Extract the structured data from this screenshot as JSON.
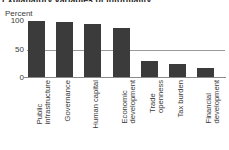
{
  "chart_data": {
    "type": "bar",
    "title": "Explanatory variables of informality",
    "subtitle": "",
    "ylabel": "Percent",
    "xlabel": "",
    "ylim": [
      0,
      100
    ],
    "yticks": [
      0,
      50,
      100
    ],
    "ytick_labels": [
      "0",
      "50",
      "100"
    ],
    "grid": false,
    "legend": "none",
    "bar_color": "#3b3b3b",
    "reference_line": {
      "value": 50,
      "color": "#9a9a9a",
      "label": ""
    },
    "categories": [
      "Public infrastructure",
      "Governance",
      "Human capital",
      "Economic development",
      "Trade openness",
      "Tax burden",
      "Financial development"
    ],
    "category_lines": [
      [
        "Public",
        "infrastructure"
      ],
      [
        "Governance"
      ],
      [
        "Human capital"
      ],
      [
        "Economic",
        "development"
      ],
      [
        "Trade",
        "openness"
      ],
      [
        "Tax burden"
      ],
      [
        "Financial",
        "development"
      ]
    ],
    "values": [
      100,
      98,
      94,
      88,
      30,
      25,
      17
    ]
  }
}
